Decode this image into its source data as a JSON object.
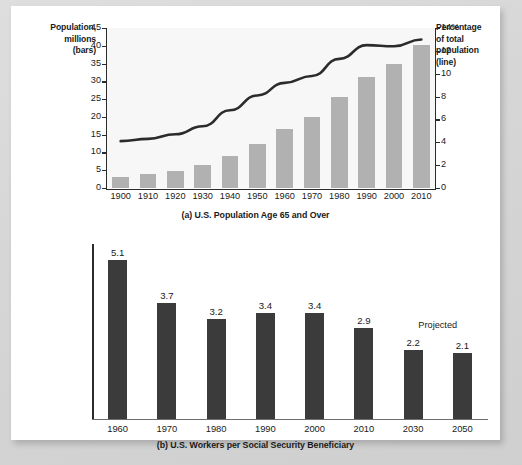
{
  "figure": {
    "background_color": "#d9d9d9",
    "card_color": "#ffffff"
  },
  "chart_data": [
    {
      "type": "bar",
      "panel": "a",
      "title": "(a) U.S. Population Age 65 and Over",
      "categories": [
        "1900",
        "1910",
        "1920",
        "1930",
        "1940",
        "1950",
        "1960",
        "1970",
        "1980",
        "1990",
        "2000",
        "2010"
      ],
      "series": [
        {
          "name": "Population, millions (bars)",
          "chart": "bar",
          "color": "#b1b1b1",
          "axis": "left",
          "values": [
            3.1,
            3.9,
            4.9,
            6.6,
            9.0,
            12.4,
            16.6,
            20.1,
            25.5,
            31.2,
            35.0,
            40.3
          ]
        },
        {
          "name": "Percentage of total population (line)",
          "chart": "line",
          "color": "#2b2b2b",
          "axis": "right",
          "values": [
            4.1,
            4.3,
            4.7,
            5.4,
            6.8,
            8.1,
            9.2,
            9.8,
            11.3,
            12.5,
            12.4,
            13.0
          ]
        }
      ],
      "left_axis": {
        "label": "Population,\nmillions\n(bars)",
        "label_lines": [
          "Population,",
          "millions",
          "(bars)"
        ],
        "ticks": [
          0,
          5,
          10,
          15,
          20,
          25,
          30,
          35,
          40,
          45
        ],
        "ylim": [
          0,
          45
        ]
      },
      "right_axis": {
        "label_lines": [
          "Percentage",
          "of total",
          "population",
          "(line)"
        ],
        "ticks": [
          "0",
          "2",
          "4",
          "6",
          "8",
          "10",
          "12",
          "14%"
        ],
        "tick_values": [
          0,
          2,
          4,
          6,
          8,
          10,
          12,
          14
        ],
        "ylim": [
          0,
          14
        ]
      },
      "xlabel": "",
      "grid": false,
      "legend": "axis-titles"
    },
    {
      "type": "bar",
      "panel": "b",
      "title": "(b) U.S. Workers per Social Security Beneficiary",
      "categories": [
        "1960",
        "1970",
        "1980",
        "1990",
        "2000",
        "2010",
        "2030",
        "2050"
      ],
      "values": [
        5.1,
        3.7,
        3.2,
        3.4,
        3.4,
        2.9,
        2.2,
        2.1
      ],
      "data_labels": [
        "5.1",
        "3.7",
        "3.2",
        "3.4",
        "3.4",
        "2.9",
        "2.2",
        "2.1"
      ],
      "bar_color": "#3b3b3b",
      "annotation": "Projected",
      "annotation_covers": [
        "2030",
        "2050"
      ],
      "ylim": [
        0,
        5.6
      ],
      "xlabel": "",
      "ylabel": "",
      "grid": false
    }
  ]
}
